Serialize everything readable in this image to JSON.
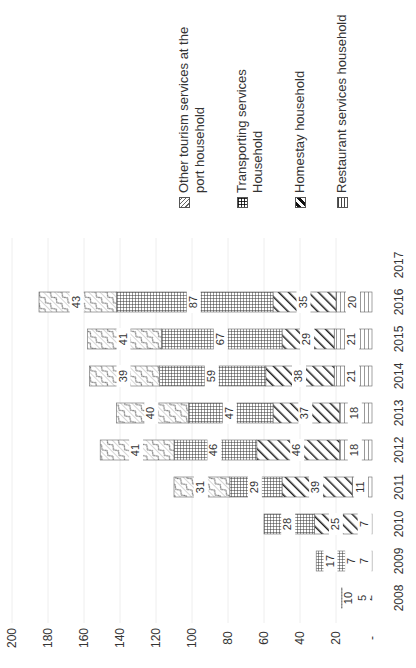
{
  "chart_data": {
    "type": "bar",
    "stacked": true,
    "orientation": "vertical (image rotated 90° counter-clockwise)",
    "title": "",
    "xlabel": "",
    "ylabel": "",
    "categories": [
      "2008",
      "2009",
      "2010",
      "2011",
      "2012",
      "2013",
      "2014",
      "2015",
      "2016",
      "2017"
    ],
    "series": [
      {
        "name": "Restaurant services household",
        "pattern": "horizontal-lines",
        "values": [
          2,
          7,
          7,
          11,
          18,
          18,
          21,
          21,
          20,
          0
        ]
      },
      {
        "name": "Homestay household",
        "pattern": "diagonal-stripes",
        "values": [
          5,
          7,
          25,
          39,
          46,
          37,
          38,
          29,
          35,
          0
        ]
      },
      {
        "name": "Transporting services Household",
        "pattern": "grid",
        "values": [
          10,
          17,
          28,
          29,
          46,
          47,
          59,
          67,
          87,
          0
        ]
      },
      {
        "name": "Other tourism services at the port household",
        "pattern": "wave-crosshatch",
        "values": [
          0,
          0,
          0,
          31,
          41,
          40,
          39,
          41,
          43,
          0
        ]
      }
    ],
    "data_labels": {
      "2008": [
        "2",
        "5",
        "10",
        ""
      ],
      "2009": [
        "7",
        "7",
        "17",
        ""
      ],
      "2010": [
        "7",
        "25",
        "28",
        ""
      ],
      "2011": [
        "11",
        "39",
        "29",
        "31"
      ],
      "2012": [
        "18",
        "46",
        "46",
        "41"
      ],
      "2013": [
        "18",
        "37",
        "47",
        "40"
      ],
      "2014": [
        "21",
        "38",
        "59",
        "39"
      ],
      "2015": [
        "21",
        "29",
        "67",
        "41"
      ],
      "2016": [
        "20",
        "35",
        "87",
        "43"
      ],
      "2017": [
        "",
        "",
        "",
        ""
      ]
    },
    "yticks": [
      "-",
      "20",
      "40",
      "60",
      "80",
      "100",
      "120",
      "140",
      "160",
      "180",
      "200"
    ],
    "ylim": [
      0,
      200
    ],
    "grid": true,
    "legend_position": "right"
  },
  "legend": {
    "items": [
      {
        "label": "Other tourism services at the port household",
        "icon": "wave-hatch-swatch"
      },
      {
        "label": "Transporting services Household",
        "icon": "grid-swatch"
      },
      {
        "label": "Homestay household",
        "icon": "diagonal-swatch"
      },
      {
        "label": "Restaurant services household",
        "icon": "hline-swatch"
      }
    ]
  }
}
